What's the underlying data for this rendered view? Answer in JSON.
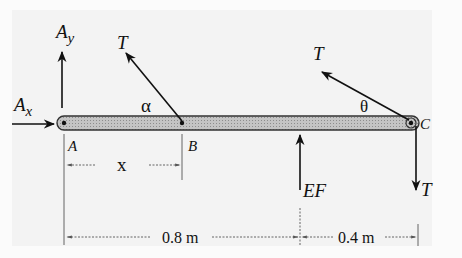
{
  "diagram": {
    "colors": {
      "background": "#f3f3f3",
      "bar_fill": "#b9b9b9",
      "bar_stroke": "#333333",
      "ink": "#111111",
      "dim_line": "#555555"
    },
    "points": {
      "A": "A",
      "B": "B",
      "C": "C"
    },
    "forces": {
      "Ax": {
        "base": "A",
        "sub": "x"
      },
      "Ay": {
        "base": "A",
        "sub": "y"
      },
      "T_at_B": "T",
      "T_at_C_angled": "T",
      "T_at_C_down": "T",
      "EF": "EF"
    },
    "angles": {
      "alpha": "α",
      "theta": "θ"
    },
    "dimensions": {
      "x": "x",
      "AC_left": "0.8 m",
      "AC_right": "0.4 m"
    }
  }
}
